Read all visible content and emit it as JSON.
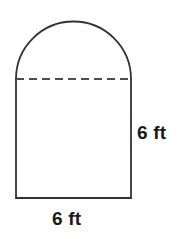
{
  "figure": {
    "name": "silo-shape-rectangle-with-semicircular-arch",
    "stroke_color": "#333333",
    "dashed_color": "#4d4d4d",
    "background_color": "#ffffff",
    "text_color": "#1a1a1a",
    "parts": {
      "arch": "semicircle",
      "body": "rectangle",
      "divider": "dashed-line"
    },
    "geometry": {
      "left_x": 16,
      "right_x": 131,
      "divider_y": 79,
      "bottom_y": 198,
      "arch_top_y": 21,
      "arch_radius": 57.5,
      "rect_width": 115,
      "rect_height": 119
    }
  },
  "labels": {
    "height": "6 ft",
    "width": "6 ft"
  }
}
